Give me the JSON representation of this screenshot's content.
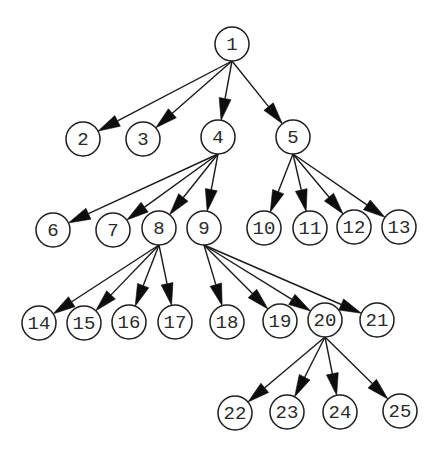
{
  "diagram": {
    "type": "tree",
    "directed": true,
    "style": {
      "background": "#ffffff",
      "stroke_color": "#1f1f1f",
      "arrowhead_color": "#0d0d0d",
      "label_color": "#2a2a2a",
      "node_radius": 17,
      "arrowhead_length": 22,
      "arrowhead_half_width": 6
    },
    "nodes": [
      {
        "id": "1",
        "label": "1",
        "x": 232,
        "y": 44
      },
      {
        "id": "2",
        "label": "2",
        "x": 83,
        "y": 139
      },
      {
        "id": "3",
        "label": "3",
        "x": 143,
        "y": 139
      },
      {
        "id": "4",
        "label": "4",
        "x": 218,
        "y": 137
      },
      {
        "id": "5",
        "label": "5",
        "x": 293,
        "y": 137
      },
      {
        "id": "6",
        "label": "6",
        "x": 53,
        "y": 230
      },
      {
        "id": "7",
        "label": "7",
        "x": 113,
        "y": 230
      },
      {
        "id": "8",
        "label": "8",
        "x": 159,
        "y": 228
      },
      {
        "id": "9",
        "label": "9",
        "x": 204,
        "y": 228
      },
      {
        "id": "10",
        "label": "10",
        "x": 264,
        "y": 228
      },
      {
        "id": "11",
        "label": "11",
        "x": 310,
        "y": 228
      },
      {
        "id": "12",
        "label": "12",
        "x": 354,
        "y": 227
      },
      {
        "id": "13",
        "label": "13",
        "x": 399,
        "y": 227
      },
      {
        "id": "14",
        "label": "14",
        "x": 39,
        "y": 323
      },
      {
        "id": "15",
        "label": "15",
        "x": 84,
        "y": 323
      },
      {
        "id": "16",
        "label": "16",
        "x": 129,
        "y": 322
      },
      {
        "id": "17",
        "label": "17",
        "x": 175,
        "y": 322
      },
      {
        "id": "18",
        "label": "18",
        "x": 227,
        "y": 322
      },
      {
        "id": "19",
        "label": "19",
        "x": 280,
        "y": 321
      },
      {
        "id": "20",
        "label": "20",
        "x": 325,
        "y": 320
      },
      {
        "id": "21",
        "label": "21",
        "x": 377,
        "y": 320
      },
      {
        "id": "22",
        "label": "22",
        "x": 235,
        "y": 413
      },
      {
        "id": "23",
        "label": "23",
        "x": 287,
        "y": 412
      },
      {
        "id": "24",
        "label": "24",
        "x": 340,
        "y": 412
      },
      {
        "id": "25",
        "label": "25",
        "x": 400,
        "y": 411
      }
    ],
    "edges": [
      {
        "from": "1",
        "to": "2"
      },
      {
        "from": "1",
        "to": "3"
      },
      {
        "from": "1",
        "to": "4"
      },
      {
        "from": "1",
        "to": "5"
      },
      {
        "from": "4",
        "to": "6"
      },
      {
        "from": "4",
        "to": "7"
      },
      {
        "from": "4",
        "to": "8"
      },
      {
        "from": "4",
        "to": "9"
      },
      {
        "from": "5",
        "to": "10"
      },
      {
        "from": "5",
        "to": "11"
      },
      {
        "from": "5",
        "to": "12"
      },
      {
        "from": "5",
        "to": "13"
      },
      {
        "from": "8",
        "to": "14"
      },
      {
        "from": "8",
        "to": "15"
      },
      {
        "from": "8",
        "to": "16"
      },
      {
        "from": "8",
        "to": "17"
      },
      {
        "from": "9",
        "to": "18"
      },
      {
        "from": "9",
        "to": "19"
      },
      {
        "from": "9",
        "to": "20"
      },
      {
        "from": "9",
        "to": "21"
      },
      {
        "from": "20",
        "to": "22"
      },
      {
        "from": "20",
        "to": "23"
      },
      {
        "from": "20",
        "to": "24"
      },
      {
        "from": "20",
        "to": "25"
      }
    ]
  }
}
